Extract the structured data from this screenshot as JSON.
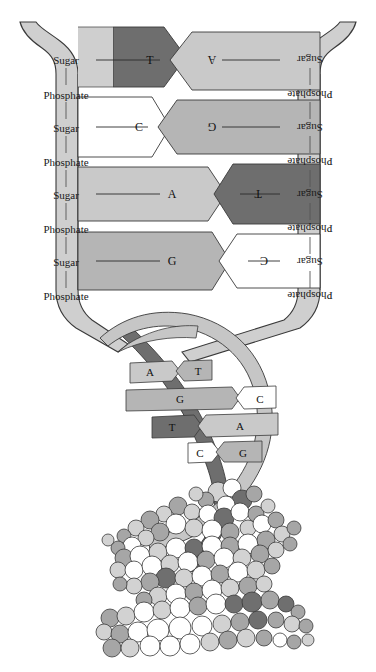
{
  "figure": {
    "sections": [
      "untwisted-ladder",
      "double-helix",
      "space-filling-model"
    ]
  },
  "colors": {
    "backbone": "#cfcfcf",
    "base_dark": "#6e6e6e",
    "base_mid": "#b5b5b5",
    "base_light": "#c9c9c9",
    "base_white": "#ffffff",
    "ribbon_dark": "#6e6e6e",
    "ribbon_light": "#c6c6c6",
    "outline": "#3a3a3a",
    "text": "#1a1a1a",
    "atom_white": "#ffffff",
    "atom_light": "#d2d2d2",
    "atom_mid": "#a6a6a6",
    "atom_dark": "#6f6f6f"
  },
  "ladder": {
    "left_backbone_labels": [
      "Sugar",
      "Phosphate",
      "Sugar",
      "Phosphate",
      "Sugar",
      "Phosphate",
      "Sugar",
      "Phosphate"
    ],
    "right_backbone_labels": [
      "Sugar",
      "Phosphate",
      "Sugar",
      "Phosphate",
      "Sugar",
      "Phosphate",
      "Sugar",
      "Phosphate"
    ],
    "rows": [
      {
        "left_base": "T",
        "right_base": "A",
        "left_color": "base_dark",
        "right_color": "base_light",
        "notch_side": "left"
      },
      {
        "left_base": "C",
        "right_base": "G",
        "left_color": "base_white",
        "right_color": "base_mid",
        "notch_side": "left"
      },
      {
        "left_base": "A",
        "right_base": "T",
        "left_color": "base_light",
        "right_color": "base_dark",
        "notch_side": "right"
      },
      {
        "left_base": "G",
        "right_base": "C",
        "left_color": "base_mid",
        "right_color": "base_white",
        "notch_side": "right"
      }
    ]
  },
  "helix": {
    "rungs": [
      {
        "left_base": "A",
        "right_base": "T",
        "left_color": "base_light",
        "right_color": "base_mid"
      },
      {
        "left_base": "G",
        "right_base": "C",
        "left_color": "base_mid",
        "right_color": "base_white"
      },
      {
        "left_base": "T",
        "right_base": "A",
        "left_color": "base_dark",
        "right_color": "base_light"
      },
      {
        "left_base": "C",
        "right_base": "G",
        "left_color": "base_white",
        "right_color": "base_mid"
      }
    ]
  },
  "space_filling_model": {
    "description": "space-filling atomic model of the DNA double helix",
    "atom_shades": [
      "atom_white",
      "atom_light",
      "atom_mid",
      "atom_dark"
    ]
  }
}
